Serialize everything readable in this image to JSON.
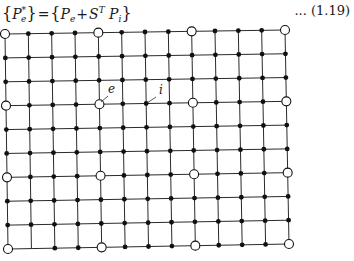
{
  "equation": {
    "lhs_symbol": "P",
    "lhs_sub": "e",
    "lhs_sup": "*",
    "equals": "=",
    "rhs_term1_symbol": "P",
    "rhs_term1_sub": "e",
    "plus": "+",
    "rhs_term2_symbol": "S",
    "rhs_term2_sup": "T",
    "rhs_term3_symbol": "P",
    "rhs_term3_sub": "i",
    "open_brace": "{",
    "close_brace": "}",
    "number": "... (1.19)"
  },
  "mesh": {
    "columns": 13,
    "rows": 10,
    "corners": {
      "top_left": [
        5,
        34
      ],
      "top_right": [
        285,
        30
      ],
      "bottom_left": [
        8,
        249
      ],
      "bottom_right": [
        289,
        244
      ]
    },
    "external_node_columns": [
      0,
      4,
      8,
      12
    ],
    "external_node_rows": [
      0,
      3,
      6,
      9
    ],
    "missing_nodes": [
      [
        9,
        1
      ]
    ],
    "line_color": "#2a2a2a",
    "node_color": "#111111"
  },
  "labels": [
    {
      "text": "e",
      "x": 106,
      "y": 94,
      "leader": [
        [
          101,
          102
        ],
        [
          108,
          96
        ]
      ]
    },
    {
      "text": "i",
      "x": 157,
      "y": 95,
      "leader": [
        [
          147,
          103
        ],
        [
          156,
          97
        ]
      ]
    }
  ]
}
